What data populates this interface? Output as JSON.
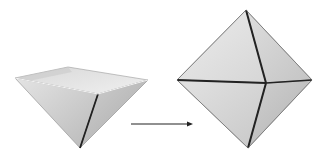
{
  "figure": {
    "left_shape": "open-inverted-pyramid",
    "arrow": "right-arrow",
    "right_shape": "octahedron",
    "colors": {
      "face_light": "#e6e6e6",
      "face_mid": "#cfcfcf",
      "face_dark": "#b8b8b8",
      "edge": "#222222",
      "background": "#ffffff"
    }
  }
}
